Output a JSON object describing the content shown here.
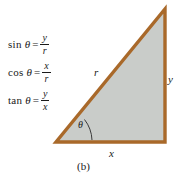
{
  "figure": {
    "caption": "(b)",
    "colors": {
      "background": "#ffffff",
      "triangle_fill": "#c9ccc9",
      "triangle_stroke": "#a9692a",
      "text": "#1a1a1a"
    }
  },
  "formulas": [
    {
      "function": "sin",
      "variable": "θ",
      "equals": "=",
      "numerator": "y",
      "denominator": "r"
    },
    {
      "function": "cos",
      "variable": "θ",
      "equals": "=",
      "numerator": "x",
      "denominator": "r"
    },
    {
      "function": "tan",
      "variable": "θ",
      "equals": "=",
      "numerator": "y",
      "denominator": "x"
    }
  ],
  "triangle": {
    "hypotenuse_label": "r",
    "vertical_label": "y",
    "horizontal_label": "x",
    "angle_label": "θ"
  }
}
